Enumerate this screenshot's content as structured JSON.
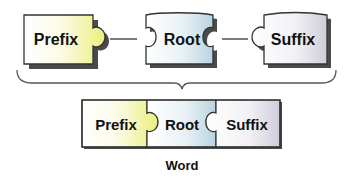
{
  "diagram": {
    "parts": [
      {
        "id": "prefix",
        "label": "Prefix",
        "color": "#eef08a"
      },
      {
        "id": "root",
        "label": "Root",
        "color": "#cfe0ea"
      },
      {
        "id": "suffix",
        "label": "Suffix",
        "color": "#d9d6e2"
      }
    ],
    "combined": {
      "parts": [
        "Prefix",
        "Root",
        "Suffix"
      ]
    },
    "caption": "Word",
    "colors": {
      "outline": "#333333",
      "shadow": "#4a4a4a",
      "connector": "#444444",
      "brace": "#555555"
    }
  }
}
